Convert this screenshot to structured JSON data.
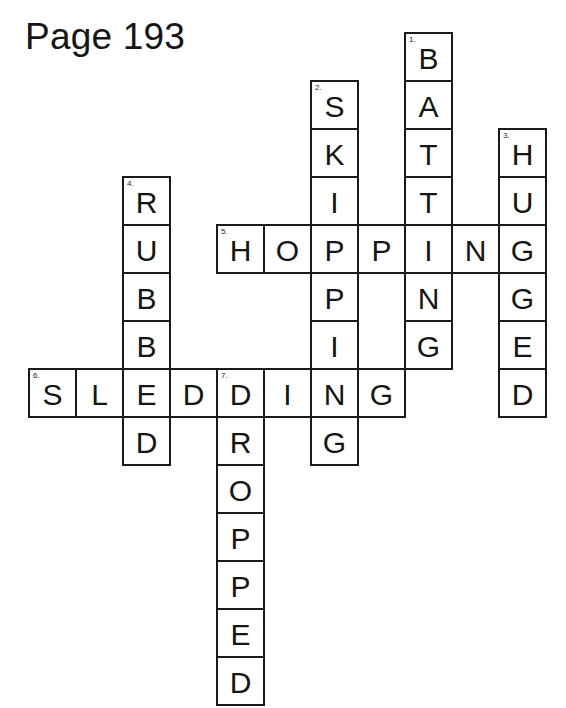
{
  "page": {
    "title": "Page 193"
  },
  "grid_layout": {
    "origin_x": 28,
    "origin_y": 32,
    "cell_width": 47,
    "cell_height": 48
  },
  "words": [
    {
      "number": "1.",
      "answer": "BATTING",
      "direction": "down",
      "col": 8,
      "row": 0
    },
    {
      "number": "2.",
      "answer": "SKIPPING",
      "direction": "down",
      "col": 6,
      "row": 1
    },
    {
      "number": "3.",
      "answer": "HUGGED",
      "direction": "down",
      "col": 10,
      "row": 2
    },
    {
      "number": "4.",
      "answer": "RUBBED",
      "direction": "down",
      "col": 2,
      "row": 3
    },
    {
      "number": "5.",
      "answer": "HOPPING",
      "direction": "across",
      "col": 4,
      "row": 4
    },
    {
      "number": "6.",
      "answer": "SLEDDING",
      "direction": "across",
      "col": 0,
      "row": 7
    },
    {
      "number": "7.",
      "answer": "DROPPED",
      "direction": "down",
      "col": 4,
      "row": 7
    }
  ]
}
